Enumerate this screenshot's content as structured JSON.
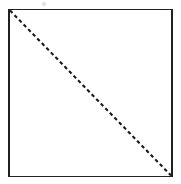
{
  "figure": {
    "canvas": {
      "width": 181,
      "height": 184,
      "background_color": "#ffffff"
    },
    "square": {
      "name": "square-outline",
      "x": 9,
      "y": 9.5,
      "width": 163,
      "height": 167,
      "stroke_color": "#231f20",
      "stroke_width": 1.8,
      "fill_color": "#ffffff"
    },
    "diagonal": {
      "name": "dashed-diagonal-line",
      "x1": 10,
      "y1": 10.5,
      "x2": 171,
      "y2": 175.5,
      "stroke_color": "#1a1a1a",
      "stroke_width": 2.1,
      "dash_length": 3.6,
      "gap_length": 2.9,
      "direction": "top-left to bottom-right"
    },
    "artifact": {
      "name": "scan-smudge",
      "x": 43,
      "y": 3,
      "color": "#969696"
    }
  }
}
